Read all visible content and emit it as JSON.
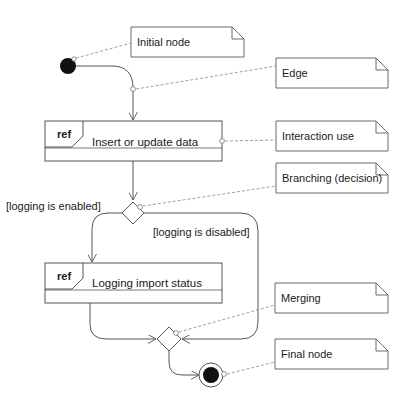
{
  "diagram": {
    "type": "UML activity diagram",
    "colors": {
      "line": "#555555",
      "note_border": "#6a6a6a",
      "dashed": "#888888",
      "node_fill": "#111111",
      "background": "#ffffff"
    },
    "actions": [
      {
        "ref_label": "ref",
        "label": "Insert or update data"
      },
      {
        "ref_label": "ref",
        "label": "Logging import status"
      }
    ],
    "guards": {
      "enabled": "[logging is enabled]",
      "disabled": "[logging is disabled]"
    },
    "notes": [
      {
        "label": "Initial node"
      },
      {
        "label": "Edge"
      },
      {
        "label": "Interaction use"
      },
      {
        "label": "Branching (decision)"
      },
      {
        "label": "Merging"
      },
      {
        "label": "Final node"
      }
    ]
  }
}
